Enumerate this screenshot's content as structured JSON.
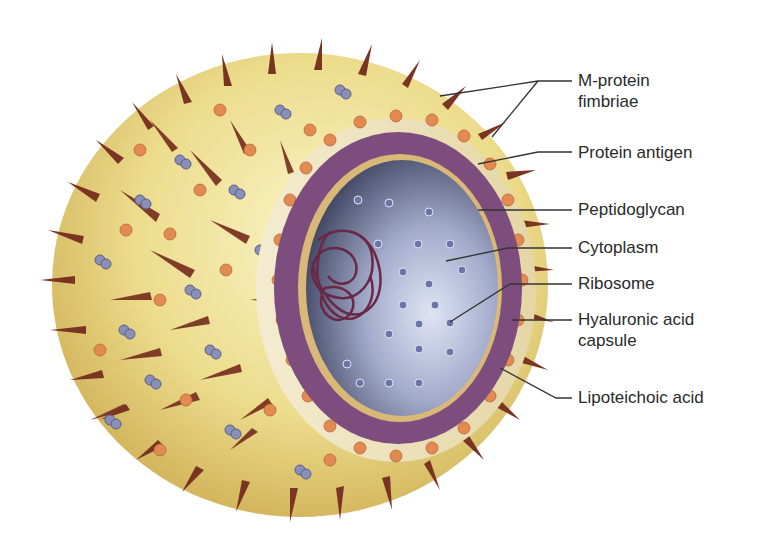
{
  "colors": {
    "capsule_fill": "#ecdc8c",
    "capsule_shadow": "#c9a64a",
    "fimbriae": "#7a3522",
    "protein_antigen": "#8a8fb8",
    "lipoteichoic_bead": "#e28a50",
    "peptidoglycan": "#7d4d7e",
    "membrane": "#d9b878",
    "cytoplasm_dark": "#343a52",
    "cytoplasm_light": "#c8d0e8",
    "ribosome": "#6c75a8",
    "nucleoid": "#6a2848",
    "leader_line": "#333333"
  },
  "labels": [
    {
      "id": "m-protein-fimbriae",
      "lines": [
        "M-protein",
        "fimbriae"
      ],
      "x": 578,
      "y": 74
    },
    {
      "id": "protein-antigen",
      "lines": [
        "Protein antigen"
      ],
      "x": 578,
      "y": 144
    },
    {
      "id": "peptidoglycan",
      "lines": [
        "Peptidoglycan"
      ],
      "x": 578,
      "y": 198
    },
    {
      "id": "cytoplasm",
      "lines": [
        "Cytoplasm"
      ],
      "x": 578,
      "y": 236
    },
    {
      "id": "ribosome",
      "lines": [
        "Ribosome"
      ],
      "x": 578,
      "y": 274
    },
    {
      "id": "hyaluronic-acid-capsule",
      "lines": [
        "Hyaluronic acid",
        "capsule"
      ],
      "x": 578,
      "y": 310
    },
    {
      "id": "lipoteichoic-acid",
      "lines": [
        "Lipoteichoic acid"
      ],
      "x": 578,
      "y": 388
    }
  ]
}
